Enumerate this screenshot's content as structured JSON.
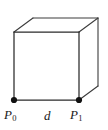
{
  "figure": {
    "background_color": "#ffffff",
    "edge_color": "#3c3c3c",
    "front_edge_color": "#2b2b2b",
    "vertex_color": "#111111",
    "label_color": "#1a1a1a"
  },
  "labels": {
    "p0": {
      "base": "P",
      "sub": "0",
      "text": "P0"
    },
    "d": {
      "text": "d"
    },
    "p1": {
      "base": "P",
      "sub": "1",
      "text": "P1"
    }
  },
  "geometry": {
    "front_face": [
      [
        14,
        32
      ],
      [
        79,
        32
      ],
      [
        79,
        100
      ],
      [
        14,
        100
      ]
    ],
    "back_face": [
      [
        33,
        18
      ],
      [
        98,
        18
      ],
      [
        98,
        86
      ],
      [
        33,
        86
      ]
    ],
    "depth_offset": {
      "dx": 19,
      "dy": -14
    },
    "vertices_marked": [
      {
        "name": "P0",
        "x": 14,
        "y": 100
      },
      {
        "name": "P1",
        "x": 79,
        "y": 100
      }
    ],
    "dot_radius": 3.1
  }
}
